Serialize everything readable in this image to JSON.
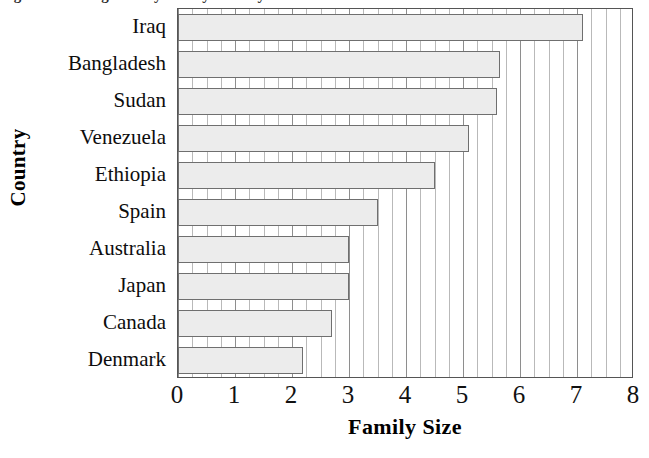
{
  "figure": {
    "caption_remnant": "Figure 1.  Average family size by country",
    "x_axis_title": "Family Size",
    "y_axis_title": "Country"
  },
  "chart_data": {
    "type": "bar",
    "orientation": "horizontal",
    "title": "",
    "xlabel": "Family Size",
    "ylabel": "Country",
    "xlim": [
      0,
      8
    ],
    "xticks": [
      "0",
      "1",
      "2",
      "3",
      "4",
      "5",
      "6",
      "7",
      "8"
    ],
    "xtick_values": [
      0,
      1,
      2,
      3,
      4,
      5,
      6,
      7,
      8
    ],
    "minor_gridlines_per_unit": 4,
    "grid": true,
    "legend": "none",
    "categories": [
      "Iraq",
      "Bangladesh",
      "Sudan",
      "Venezuela",
      "Ethiopia",
      "Spain",
      "Australia",
      "Japan",
      "Canada",
      "Denmark"
    ],
    "values": [
      7.1,
      5.65,
      5.6,
      5.1,
      4.5,
      3.5,
      3.0,
      3.0,
      2.7,
      2.2
    ],
    "bar_fill_color": "#ececec",
    "bar_border_color": "#6f6f6f",
    "plot_border_color": "#555555",
    "grid_color": "#b9b9b9"
  }
}
